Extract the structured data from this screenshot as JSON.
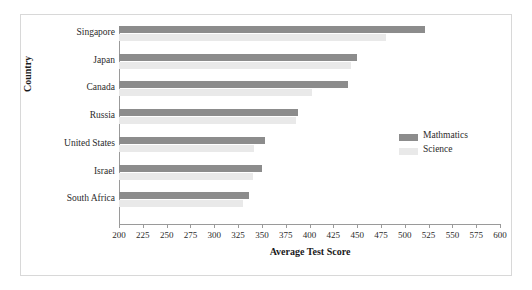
{
  "chart_data": {
    "type": "bar",
    "orientation": "horizontal",
    "title": "",
    "xlabel": "Average Test Score",
    "ylabel": "Country",
    "categories": [
      "Singapore",
      "Japan",
      "Canada",
      "Russia",
      "United States",
      "Israel",
      "South Africa"
    ],
    "series": [
      {
        "name": "Mathmatics",
        "color": "#8c8c8c",
        "values": [
          521,
          450,
          440,
          388,
          353,
          350,
          336
        ]
      },
      {
        "name": "Science",
        "color": "#e9e9e9",
        "values": [
          480,
          444,
          403,
          386,
          342,
          341,
          330
        ]
      }
    ],
    "xlim": [
      200,
      600
    ],
    "xticks": [
      200,
      225,
      250,
      275,
      300,
      325,
      350,
      375,
      400,
      425,
      450,
      475,
      500,
      525,
      550,
      575,
      600
    ],
    "grid": false,
    "legend_position": "right-middle"
  },
  "legend": {
    "entries": [
      {
        "label": "Mathmatics",
        "color": "#8c8c8c"
      },
      {
        "label": "Science",
        "color": "#e9e9e9"
      }
    ]
  },
  "colors": {
    "mathmatics": "#8c8c8c",
    "science": "#e9e9e9",
    "axis": "#9a9a9a",
    "border": "#d8d8d8",
    "text": "#2b2b2b",
    "background": "#ffffff"
  }
}
